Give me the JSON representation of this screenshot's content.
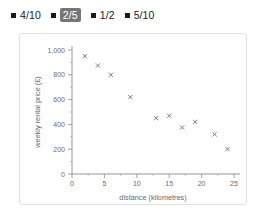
{
  "options": {
    "items": [
      {
        "label": "4/10",
        "selected": false,
        "marker": "square-marker"
      },
      {
        "label": "2/5",
        "selected": true,
        "marker": "square-marker"
      },
      {
        "label": "1/2",
        "selected": false,
        "marker": "square-marker"
      },
      {
        "label": "5/10",
        "selected": false,
        "marker": "square-marker"
      }
    ],
    "selected_value": "2/5",
    "selected_bg": "#767676",
    "marker_color": "#1a1a1a"
  },
  "chart_data": {
    "type": "scatter",
    "title": "",
    "xlabel": "distance (kilometres)",
    "ylabel": "weekly rental price (£)",
    "xlim": [
      0,
      25
    ],
    "ylim": [
      0,
      1000
    ],
    "xticks": [
      0,
      5,
      10,
      15,
      20,
      25
    ],
    "xtick_labels": [
      "0",
      "5",
      "10",
      "15",
      "20",
      "25"
    ],
    "yticks": [
      0,
      200,
      400,
      600,
      800,
      1000
    ],
    "ytick_labels": [
      "0",
      "200",
      "400",
      "600",
      "800",
      "1,000"
    ],
    "grid": false,
    "legend": "none",
    "marker_style": "x",
    "marker_color": "#6e6e6e",
    "x": [
      2,
      4,
      6,
      9,
      13,
      15,
      17,
      19,
      22,
      24
    ],
    "y": [
      950,
      875,
      800,
      620,
      450,
      470,
      375,
      420,
      320,
      200
    ],
    "points": [
      {
        "x": 2,
        "y": 950
      },
      {
        "x": 4,
        "y": 875
      },
      {
        "x": 6,
        "y": 800
      },
      {
        "x": 9,
        "y": 620
      },
      {
        "x": 13,
        "y": 450
      },
      {
        "x": 15,
        "y": 470
      },
      {
        "x": 17,
        "y": 375
      },
      {
        "x": 19,
        "y": 420
      },
      {
        "x": 22,
        "y": 320
      },
      {
        "x": 24,
        "y": 200
      }
    ]
  }
}
